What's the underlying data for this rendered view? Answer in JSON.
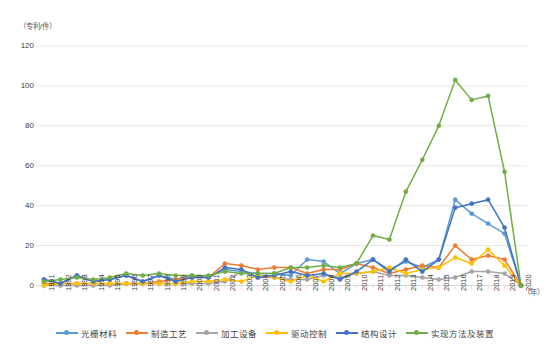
{
  "chart_data": {
    "type": "line",
    "title": "",
    "xlabel": "（年）",
    "ylabel": "（专利/件）",
    "ylim": [
      0,
      120
    ],
    "yticks": [
      0,
      20,
      40,
      60,
      80,
      100,
      120
    ],
    "grid": true,
    "legend_position": "bottom",
    "categories": [
      "1991",
      "1992",
      "1993",
      "1994",
      "1995",
      "1996",
      "1997",
      "1998",
      "1999",
      "2000",
      "2001",
      "2002",
      "2003",
      "2004",
      "2005",
      "2006",
      "2007",
      "2008",
      "2009",
      "2010",
      "2011",
      "2012",
      "2013",
      "2014",
      "2015",
      "2016",
      "2017",
      "2018",
      "2019",
      "2020"
    ],
    "series": [
      {
        "name": "光栅材料",
        "color": "#5B9BD5",
        "values": [
          3,
          1,
          5,
          2,
          3,
          5,
          2,
          5,
          3,
          5,
          4,
          8,
          7,
          6,
          6,
          5,
          13,
          12,
          6,
          11,
          13,
          8,
          12,
          9,
          13,
          43,
          36,
          31,
          26,
          0
        ]
      },
      {
        "name": "制造工艺",
        "color": "#ED7D31",
        "values": [
          1,
          1,
          1,
          1,
          1,
          1,
          1,
          2,
          3,
          4,
          4,
          11,
          10,
          8,
          9,
          9,
          6,
          8,
          8,
          11,
          9,
          6,
          8,
          10,
          9,
          20,
          13,
          15,
          13,
          0
        ]
      },
      {
        "name": "加工设备",
        "color": "#A5A5A5",
        "values": [
          0,
          0,
          0,
          0,
          0,
          1,
          1,
          1,
          1,
          1,
          1,
          2,
          7,
          4,
          4,
          3,
          3,
          5,
          4,
          6,
          7,
          5,
          5,
          4,
          3,
          4,
          7,
          7,
          6,
          0
        ]
      },
      {
        "name": "驱动控制",
        "color": "#FFC000",
        "values": [
          0,
          1,
          1,
          1,
          1,
          1,
          1,
          1,
          1,
          2,
          2,
          3,
          2,
          5,
          4,
          2,
          5,
          2,
          6,
          6,
          7,
          9,
          6,
          8,
          9,
          14,
          11,
          18,
          10,
          0
        ]
      },
      {
        "name": "结构设计",
        "color": "#4472C4",
        "values": [
          3,
          1,
          5,
          2,
          3,
          5,
          2,
          5,
          2,
          4,
          4,
          9,
          8,
          4,
          5,
          7,
          5,
          6,
          3,
          7,
          13,
          7,
          13,
          7,
          13,
          39,
          41,
          43,
          29,
          0
        ]
      },
      {
        "name": "实现方法及装置",
        "color": "#70AD47",
        "values": [
          2,
          3,
          4,
          3,
          4,
          6,
          5,
          6,
          5,
          5,
          5,
          7,
          6,
          6,
          6,
          9,
          9,
          10,
          9,
          11,
          25,
          23,
          47,
          63,
          80,
          103,
          93,
          95,
          57,
          0
        ]
      }
    ]
  }
}
